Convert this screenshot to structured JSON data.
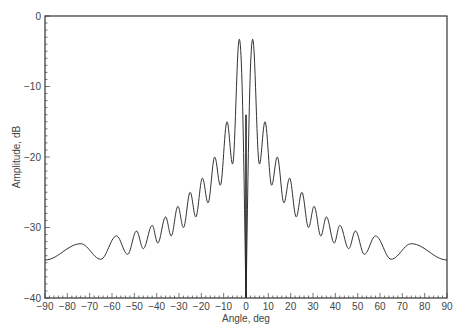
{
  "chart_data": {
    "type": "line",
    "title": "",
    "xlabel": "Angle, deg",
    "ylabel": "Amplitude, dB",
    "xlim": [
      -90,
      90
    ],
    "ylim": [
      -40,
      0
    ],
    "xticks": [
      -90,
      -80,
      -70,
      -60,
      -50,
      -40,
      -30,
      -20,
      -10,
      0,
      10,
      20,
      30,
      40,
      50,
      60,
      70,
      80,
      90
    ],
    "yticks": [
      0,
      -10,
      -20,
      -30,
      -40
    ],
    "xtick_labels": [
      "-90",
      "-80",
      "-70",
      "-60",
      "-50",
      "-40",
      "-30",
      "-20",
      "-10",
      "0",
      "10",
      "20",
      "30",
      "40",
      "50",
      "60",
      "70",
      "80",
      "90"
    ],
    "ytick_labels": [
      "0",
      "-10",
      "-20",
      "-30",
      "-40"
    ],
    "grid": false,
    "legend": null,
    "series": [
      {
        "name": "difference pattern",
        "description": "Symmetric difference (monopulse) antenna pattern with null at 0 deg",
        "main_lobe_peaks": [
          {
            "x": -3,
            "y": -3.3
          },
          {
            "x": 3,
            "y": -3.3
          }
        ],
        "null": {
          "x": 0,
          "y": -40
        },
        "sidelobe_peaks": [
          {
            "x": 8.5,
            "y": -15
          },
          {
            "x": 14,
            "y": -20
          },
          {
            "x": 19.5,
            "y": -23
          },
          {
            "x": 25,
            "y": -25
          },
          {
            "x": 30.5,
            "y": -27
          },
          {
            "x": 36,
            "y": -28.5
          },
          {
            "x": 42,
            "y": -29.7
          },
          {
            "x": 49,
            "y": -30.5
          },
          {
            "x": 58,
            "y": -31.2
          },
          {
            "x": 74,
            "y": -32.3
          }
        ],
        "sidelobe_nulls": [
          {
            "x": 6,
            "y": -21
          },
          {
            "x": 11.5,
            "y": -24
          },
          {
            "x": 17,
            "y": -26.5
          },
          {
            "x": 22.5,
            "y": -28.5
          },
          {
            "x": 28,
            "y": -30
          },
          {
            "x": 33.5,
            "y": -31.2
          },
          {
            "x": 39.5,
            "y": -32.2
          },
          {
            "x": 46,
            "y": -33
          },
          {
            "x": 53,
            "y": -33.8
          },
          {
            "x": 65,
            "y": -34.5
          }
        ],
        "endpoints": [
          {
            "x": -90,
            "y": -34.6
          },
          {
            "x": 90,
            "y": -34.6
          }
        ]
      }
    ]
  },
  "style": {
    "line_color": "#333333",
    "axis_color": "#333333",
    "background": "#ffffff"
  }
}
